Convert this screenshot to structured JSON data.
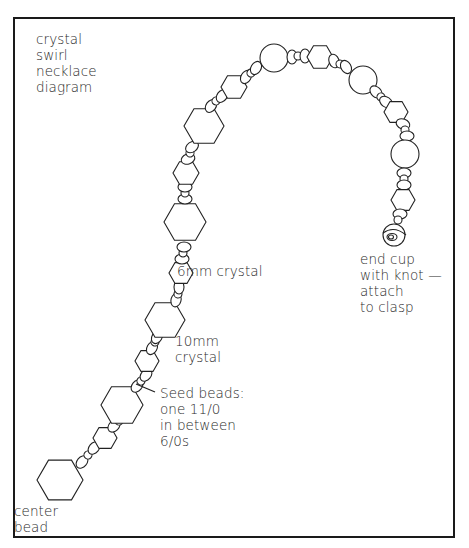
{
  "diagram": {
    "title": "crystal\nswirl\nnecklace\ndiagram",
    "labels": {
      "six_mm": "6mm crystal",
      "ten_mm": "10mm\ncrystal",
      "seed_beads": "Seed beads:\none 11/0\nin between\n6/0s",
      "center_bead": "center\nbead",
      "end_cup": "end cup\nwith knot —\nattach\nto clasp"
    },
    "colors": {
      "stroke": "#222222",
      "frame": "#1a1a1a",
      "background": "#ffffff"
    },
    "bead_types": [
      "center-hexagon",
      "10mm-crystal-hexagon",
      "6mm-crystal-hexagon",
      "round-bead",
      "6/0-seed-bead",
      "11/0-seed-bead",
      "end-cup"
    ],
    "beads": [
      {
        "type": "hex",
        "size": "large",
        "cx": 60,
        "cy": 480,
        "r": 23
      },
      {
        "type": "seed6",
        "cx": 82,
        "cy": 462,
        "rx": 7,
        "ry": 5,
        "rot": -50
      },
      {
        "type": "seed11",
        "cx": 88,
        "cy": 455,
        "rx": 4,
        "ry": 4,
        "rot": -50
      },
      {
        "type": "seed6",
        "cx": 94,
        "cy": 448,
        "rx": 7,
        "ry": 5,
        "rot": -50
      },
      {
        "type": "hex",
        "size": "small",
        "cx": 105,
        "cy": 438,
        "r": 12
      },
      {
        "type": "seed6",
        "cx": 114,
        "cy": 426,
        "rx": 7,
        "ry": 5,
        "rot": -45
      },
      {
        "type": "seed11",
        "cx": 119,
        "cy": 421,
        "rx": 4,
        "ry": 4,
        "rot": -45
      },
      {
        "type": "seed6",
        "cx": 124,
        "cy": 415,
        "rx": 7,
        "ry": 5,
        "rot": -45
      },
      {
        "type": "hex",
        "size": "large",
        "cx": 122,
        "cy": 405,
        "r": 21
      },
      {
        "type": "seed6",
        "cx": 137,
        "cy": 386,
        "rx": 7,
        "ry": 5,
        "rot": -50
      },
      {
        "type": "seed11",
        "cx": 141,
        "cy": 381,
        "rx": 4,
        "ry": 4,
        "rot": -50
      },
      {
        "type": "seed6",
        "cx": 146,
        "cy": 375,
        "rx": 7,
        "ry": 5,
        "rot": -50
      },
      {
        "type": "hex",
        "size": "small",
        "cx": 147,
        "cy": 361,
        "r": 12
      },
      {
        "type": "seed6",
        "cx": 152,
        "cy": 348,
        "rx": 7,
        "ry": 5,
        "rot": -60
      },
      {
        "type": "seed11",
        "cx": 155,
        "cy": 342,
        "rx": 4,
        "ry": 4,
        "rot": -60
      },
      {
        "type": "seed6",
        "cx": 157,
        "cy": 337,
        "rx": 7,
        "ry": 5,
        "rot": -60
      },
      {
        "type": "hex",
        "size": "large",
        "cx": 165,
        "cy": 320,
        "r": 20
      },
      {
        "type": "seed6",
        "cx": 176,
        "cy": 300,
        "rx": 7,
        "ry": 5,
        "rot": -75
      },
      {
        "type": "seed11",
        "cx": 178,
        "cy": 294,
        "rx": 4,
        "ry": 4,
        "rot": -80
      },
      {
        "type": "seed6",
        "cx": 179,
        "cy": 287,
        "rx": 7,
        "ry": 5,
        "rot": -90
      },
      {
        "type": "hex",
        "size": "small",
        "cx": 181,
        "cy": 273,
        "r": 12
      },
      {
        "type": "seed6",
        "cx": 182,
        "cy": 259,
        "rx": 7,
        "ry": 5,
        "rot": 0
      },
      {
        "type": "seed11",
        "cx": 183,
        "cy": 253,
        "rx": 4,
        "ry": 4,
        "rot": 0
      },
      {
        "type": "seed6",
        "cx": 184,
        "cy": 247,
        "rx": 7,
        "ry": 5,
        "rot": 0
      },
      {
        "type": "hex",
        "size": "large",
        "cx": 185,
        "cy": 222,
        "r": 21
      },
      {
        "type": "seed6",
        "cx": 185,
        "cy": 199,
        "rx": 7,
        "ry": 5,
        "rot": 0
      },
      {
        "type": "seed11",
        "cx": 185,
        "cy": 193,
        "rx": 4,
        "ry": 4,
        "rot": 0
      },
      {
        "type": "seed6",
        "cx": 185,
        "cy": 187,
        "rx": 7,
        "ry": 5,
        "rot": 0
      },
      {
        "type": "hex",
        "size": "small",
        "cx": 186,
        "cy": 173,
        "r": 13
      },
      {
        "type": "seed6",
        "cx": 188,
        "cy": 159,
        "rx": 7,
        "ry": 5,
        "rot": -20
      },
      {
        "type": "seed11",
        "cx": 190,
        "cy": 153,
        "rx": 4,
        "ry": 4,
        "rot": -30
      },
      {
        "type": "seed6",
        "cx": 192,
        "cy": 147,
        "rx": 7,
        "ry": 5,
        "rot": -35
      },
      {
        "type": "hex",
        "size": "large",
        "cx": 204,
        "cy": 126,
        "r": 20
      },
      {
        "type": "seed6",
        "cx": 211,
        "cy": 106,
        "rx": 7,
        "ry": 5,
        "rot": -55
      },
      {
        "type": "seed11",
        "cx": 216,
        "cy": 101,
        "rx": 4,
        "ry": 4,
        "rot": -55
      },
      {
        "type": "seed6",
        "cx": 222,
        "cy": 96,
        "rx": 7,
        "ry": 5,
        "rot": -55
      },
      {
        "type": "hex",
        "size": "small",
        "cx": 234,
        "cy": 87,
        "r": 13
      },
      {
        "type": "seed6",
        "cx": 246,
        "cy": 77,
        "rx": 7,
        "ry": 5,
        "rot": -60
      },
      {
        "type": "seed11",
        "cx": 251,
        "cy": 73,
        "rx": 4,
        "ry": 4,
        "rot": -60
      },
      {
        "type": "seed6",
        "cx": 256,
        "cy": 68,
        "rx": 7,
        "ry": 5,
        "rot": -60
      },
      {
        "type": "round",
        "cx": 274,
        "cy": 58,
        "r": 14
      },
      {
        "type": "seed6",
        "cx": 292,
        "cy": 57,
        "rx": 7,
        "ry": 5,
        "rot": 90
      },
      {
        "type": "seed11",
        "cx": 298,
        "cy": 56,
        "rx": 4,
        "ry": 4,
        "rot": 90
      },
      {
        "type": "seed6",
        "cx": 305,
        "cy": 56,
        "rx": 7,
        "ry": 5,
        "rot": 90
      },
      {
        "type": "hex",
        "size": "small",
        "cx": 320,
        "cy": 57,
        "r": 13
      },
      {
        "type": "seed6",
        "cx": 334,
        "cy": 61,
        "rx": 7,
        "ry": 5,
        "rot": 70
      },
      {
        "type": "seed11",
        "cx": 340,
        "cy": 64,
        "rx": 4,
        "ry": 4,
        "rot": 70
      },
      {
        "type": "seed6",
        "cx": 346,
        "cy": 67,
        "rx": 7,
        "ry": 5,
        "rot": 60
      },
      {
        "type": "round",
        "cx": 363,
        "cy": 80,
        "r": 14
      },
      {
        "type": "seed6",
        "cx": 376,
        "cy": 92,
        "rx": 7,
        "ry": 5,
        "rot": 45
      },
      {
        "type": "seed11",
        "cx": 381,
        "cy": 97,
        "rx": 4,
        "ry": 4,
        "rot": 40
      },
      {
        "type": "seed6",
        "cx": 386,
        "cy": 102,
        "rx": 7,
        "ry": 5,
        "rot": 35
      },
      {
        "type": "hex",
        "size": "small",
        "cx": 396,
        "cy": 112,
        "r": 12
      },
      {
        "type": "seed6",
        "cx": 403,
        "cy": 124,
        "rx": 7,
        "ry": 5,
        "rot": 20
      },
      {
        "type": "seed11",
        "cx": 405,
        "cy": 130,
        "rx": 4,
        "ry": 4,
        "rot": 10
      },
      {
        "type": "seed6",
        "cx": 407,
        "cy": 136,
        "rx": 7,
        "ry": 5,
        "rot": 0
      },
      {
        "type": "round",
        "cx": 405,
        "cy": 154,
        "r": 14
      },
      {
        "type": "seed6",
        "cx": 404,
        "cy": 173,
        "rx": 7,
        "ry": 5,
        "rot": 0
      },
      {
        "type": "seed11",
        "cx": 404,
        "cy": 179,
        "rx": 4,
        "ry": 4,
        "rot": 0
      },
      {
        "type": "seed6",
        "cx": 404,
        "cy": 185,
        "rx": 7,
        "ry": 5,
        "rot": 0
      },
      {
        "type": "hex",
        "size": "small",
        "cx": 403,
        "cy": 200,
        "r": 12
      },
      {
        "type": "seed6",
        "cx": 400,
        "cy": 214,
        "rx": 7,
        "ry": 5,
        "rot": 0
      },
      {
        "type": "seed11",
        "cx": 398,
        "cy": 220,
        "rx": 4,
        "ry": 4,
        "rot": 0
      },
      {
        "type": "endcup",
        "cx": 394,
        "cy": 234,
        "r": 11
      }
    ],
    "pointer_line": {
      "x1": 136,
      "y1": 384,
      "x2": 155,
      "y2": 392
    }
  }
}
